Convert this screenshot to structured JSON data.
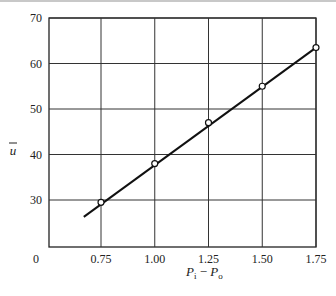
{
  "chart_data": {
    "type": "line",
    "title": "",
    "xlabel": "P_i − P_o",
    "ylabel": "ū",
    "x": [
      0.75,
      1.0,
      1.25,
      1.5,
      1.75
    ],
    "series": [
      {
        "name": "measured",
        "values": [
          29.5,
          38,
          47,
          55,
          63.5
        ],
        "marker": "open-circle"
      },
      {
        "name": "fit line",
        "x": [
          0.67,
          1.75
        ],
        "values": [
          26.3,
          63.5
        ],
        "marker": "none"
      }
    ],
    "xticks": [
      "0.75",
      "1.00",
      "1.25",
      "1.50",
      "1.75"
    ],
    "yticks": [
      "0",
      "30",
      "40",
      "50",
      "60",
      "70"
    ],
    "ylim": [
      20,
      70
    ],
    "grid": true,
    "legend": null
  },
  "labels": {
    "y_axis": "u",
    "x_axis_p1": "P",
    "x_axis_sub1": "i",
    "x_axis_minus": "−",
    "x_axis_p2": "P",
    "x_axis_sub2": "o",
    "origin": "0"
  }
}
